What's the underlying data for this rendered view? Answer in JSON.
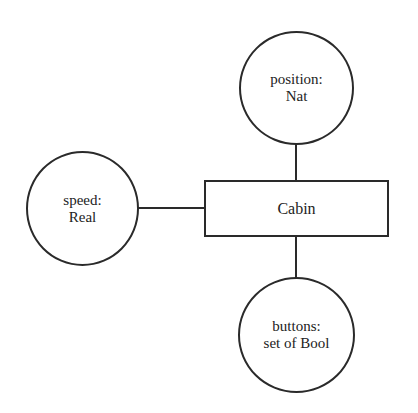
{
  "diagram": {
    "type": "entity-attribute",
    "central_entity": {
      "label": "Cabin",
      "shape": "rectangle"
    },
    "attributes": [
      {
        "id": "position",
        "name_line": "position:",
        "type_line": "Nat",
        "placement": "top",
        "shape": "circle"
      },
      {
        "id": "speed",
        "name_line": "speed:",
        "type_line": "Real",
        "placement": "left",
        "shape": "circle"
      },
      {
        "id": "buttons",
        "name_line": "buttons:",
        "type_line": "set of Bool",
        "placement": "bottom",
        "shape": "circle"
      }
    ],
    "edges": [
      {
        "from": "Cabin",
        "to": "position"
      },
      {
        "from": "Cabin",
        "to": "speed"
      },
      {
        "from": "Cabin",
        "to": "buttons"
      }
    ],
    "colors": {
      "stroke": "#2a2a2a",
      "background": "#ffffff",
      "text": "#222222"
    }
  }
}
